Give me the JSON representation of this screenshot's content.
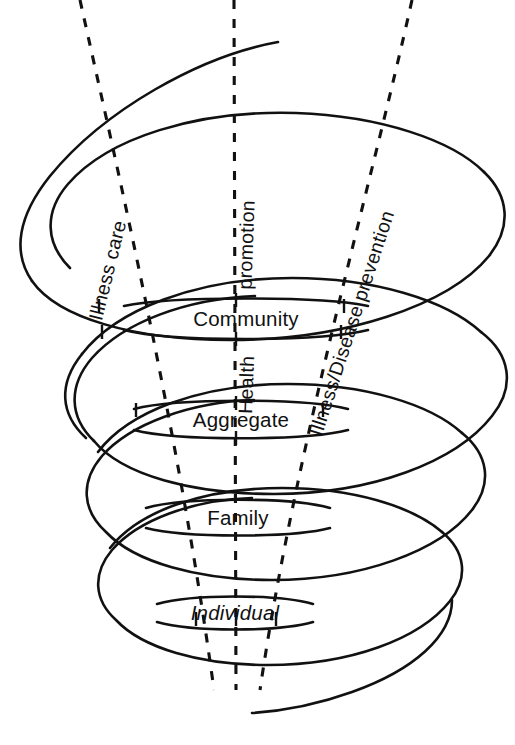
{
  "diagram": {
    "background_color": "#ffffff",
    "stroke_color": "#111111",
    "levels": [
      {
        "id": "community",
        "label": "Community",
        "italic": false,
        "cx": 246,
        "cy": 319,
        "rx": 122,
        "ry": 20
      },
      {
        "id": "aggregate",
        "label": "Aggregate",
        "italic": false,
        "cx": 241,
        "cy": 420,
        "rx": 107,
        "ry": 19
      },
      {
        "id": "family",
        "label": "Family",
        "italic": false,
        "cx": 238,
        "cy": 518,
        "rx": 92,
        "ry": 18
      },
      {
        "id": "individual",
        "label": "Individual",
        "italic": true,
        "cx": 235,
        "cy": 613,
        "rx": 78,
        "ry": 17
      }
    ],
    "axis_labels": [
      {
        "id": "illness-care",
        "text": "Illness care",
        "x": 112,
        "y": 278,
        "rotate": -76
      },
      {
        "id": "promotion",
        "text": "promotion",
        "x": 252,
        "y": 250,
        "rotate": -88
      },
      {
        "id": "health",
        "text": "Health",
        "x": 252,
        "y": 390,
        "rotate": -88
      },
      {
        "id": "illness-prevention",
        "text": "Illness/Disease prevention",
        "x": 352,
        "y": 330,
        "rotate": -72
      }
    ],
    "guides": [
      {
        "id": "guide-left",
        "x_top": 80,
        "y_top": 0,
        "x_bottom": 214,
        "y_bottom": 690
      },
      {
        "id": "guide-center",
        "x_top": 234,
        "y_top": 0,
        "x_bottom": 236,
        "y_bottom": 690
      },
      {
        "id": "guide-right",
        "x_top": 412,
        "y_top": 0,
        "x_bottom": 260,
        "y_bottom": 690
      }
    ],
    "spiral": {
      "start": {
        "x": 278,
        "y": 42
      },
      "end": {
        "x": 252,
        "y": 713
      },
      "coil_count": 5
    }
  }
}
